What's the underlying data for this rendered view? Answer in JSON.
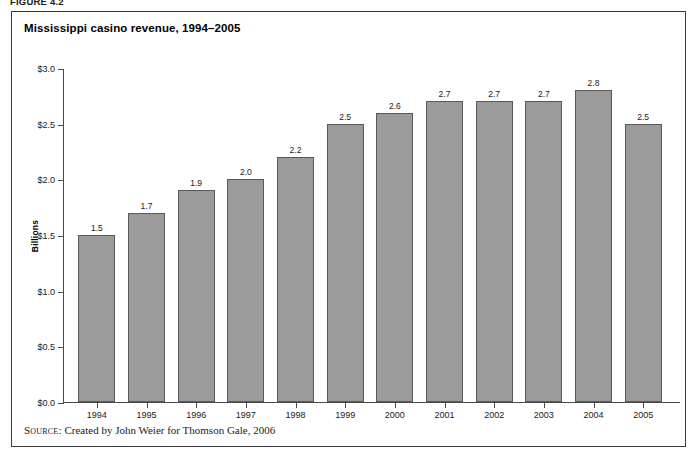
{
  "figure": {
    "label": "FIGURE 4.2",
    "title": "Mississippi casino revenue, 1994–2005",
    "source_label": "Source:",
    "source_text": "Created by John Weier for Thomson Gale, 2006"
  },
  "colors": {
    "bar_fill": "#9b9b9b",
    "bar_stroke": "#595959",
    "axis": "#4a4a4a",
    "frame": "#3a3a3a",
    "text": "#1a1a1a",
    "background": "#ffffff"
  },
  "chart_data": {
    "type": "bar",
    "title": "Mississippi casino revenue, 1994–2005",
    "xlabel": "",
    "ylabel": "Billions",
    "categories": [
      "1994",
      "1995",
      "1996",
      "1997",
      "1998",
      "1999",
      "2000",
      "2001",
      "2002",
      "2003",
      "2004",
      "2005"
    ],
    "values": [
      1.5,
      1.7,
      1.9,
      2.0,
      2.2,
      2.5,
      2.6,
      2.7,
      2.7,
      2.7,
      2.8,
      2.5
    ],
    "value_labels": [
      "1.5",
      "1.7",
      "1.9",
      "2.0",
      "2.2",
      "2.5",
      "2.6",
      "2.7",
      "2.7",
      "2.7",
      "2.8",
      "2.5"
    ],
    "ylim": [
      0.0,
      3.0
    ],
    "ytick_values": [
      0.0,
      0.5,
      1.0,
      1.5,
      2.0,
      2.5,
      3.0
    ],
    "ytick_labels": [
      "$0.0",
      "$0.5",
      "$1.0",
      "$1.5",
      "$2.0",
      "$2.5",
      "$3.0"
    ],
    "grid": false,
    "legend": null,
    "units": "Billions of dollars"
  }
}
